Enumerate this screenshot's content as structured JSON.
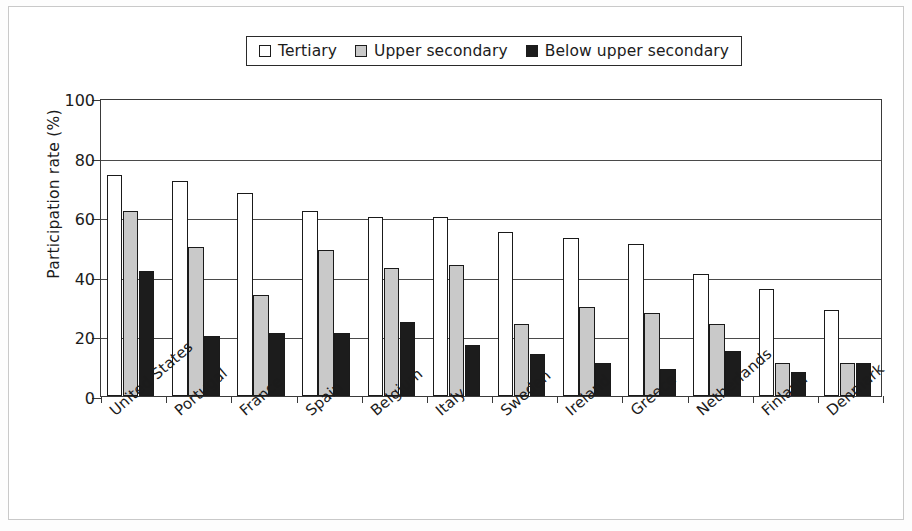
{
  "chart_data": {
    "type": "bar",
    "title": "",
    "xlabel": "",
    "ylabel": "Participation rate (%)",
    "ylim": [
      0,
      100
    ],
    "yticks": [
      0,
      20,
      40,
      60,
      80,
      100
    ],
    "grid": true,
    "legend_position": "top-center",
    "categories": [
      "United States",
      "Portugal",
      "France",
      "Spain",
      "Belgium",
      "Italy",
      "Sweden",
      "Ireland",
      "Greece",
      "Netherlands",
      "Finland",
      "Denmark"
    ],
    "series": [
      {
        "name": "Tertiary",
        "color": "#ffffff",
        "values": [
          74,
          72,
          68,
          62,
          60,
          60,
          55,
          53,
          51,
          41,
          36,
          29
        ]
      },
      {
        "name": "Upper secondary",
        "color": "#c9c9c9",
        "values": [
          62,
          50,
          34,
          49,
          43,
          44,
          24,
          30,
          28,
          24,
          11,
          11
        ]
      },
      {
        "name": "Below upper secondary",
        "color": "#1c1c1c",
        "values": [
          42,
          20,
          21,
          21,
          25,
          17,
          14,
          11,
          9,
          15,
          8,
          11
        ]
      }
    ]
  },
  "legend": {
    "items": [
      {
        "label": "Tertiary",
        "swatch": "#ffffff"
      },
      {
        "label": "Upper secondary",
        "swatch": "#c9c9c9"
      },
      {
        "label": "Below upper secondary",
        "swatch": "#1c1c1c"
      }
    ]
  }
}
